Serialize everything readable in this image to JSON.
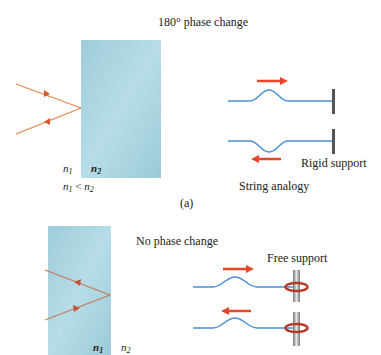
{
  "panel_a": {
    "title": "180° phase change",
    "n1_label": "n",
    "n1_sub": "1",
    "n2_label": "n",
    "n2_sub": "2",
    "inequality": {
      "lhs": "n",
      "lhs_sub": "1",
      "op": " < ",
      "rhs": "n",
      "rhs_sub": "2"
    },
    "support_label": "Rigid support",
    "analogy_label": "String analogy",
    "caption": "(a)"
  },
  "panel_b": {
    "title": "No phase change",
    "support_label": "Free support",
    "n1_label": "n",
    "n1_sub": "1",
    "n2_label": "n",
    "n2_sub": "2"
  },
  "colors": {
    "slab": "#a9d3e0",
    "ray": "#e0884a",
    "arrow": "#e8442a",
    "string": "#4a90d9",
    "rigid_support": "#555555",
    "ring": "#c0392b",
    "rod": "#9a9a9a"
  }
}
